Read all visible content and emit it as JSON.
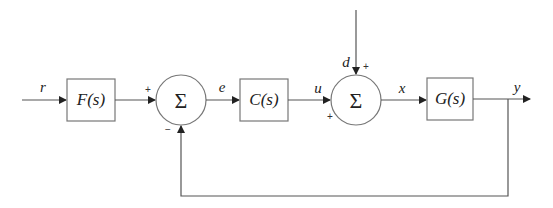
{
  "diagram": {
    "type": "feedback-control-block-diagram",
    "blocks": [
      {
        "id": "F",
        "label": "F(s)"
      },
      {
        "id": "C",
        "label": "C(s)"
      },
      {
        "id": "G",
        "label": "G(s)"
      }
    ],
    "summing_junctions": [
      {
        "id": "sum1",
        "symbol": "Σ",
        "inputs": [
          {
            "from": "F",
            "sign": "+"
          },
          {
            "from": "y-feedback",
            "sign": "−"
          }
        ],
        "output": "e"
      },
      {
        "id": "sum2",
        "symbol": "Σ",
        "inputs": [
          {
            "from": "C",
            "sign": "+"
          },
          {
            "from": "d",
            "sign": "+"
          }
        ],
        "output": "x"
      }
    ],
    "signals": {
      "r": "r",
      "e": "e",
      "u": "u",
      "d": "d",
      "x": "x",
      "y": "y"
    },
    "signs": {
      "sum1_top": "+",
      "sum1_bottom": "−",
      "sum2_top": "+",
      "sum2_left": "+"
    },
    "colors": {
      "line": "#555555",
      "box_border": "#777777",
      "text": "#222222",
      "background": "#ffffff"
    }
  }
}
